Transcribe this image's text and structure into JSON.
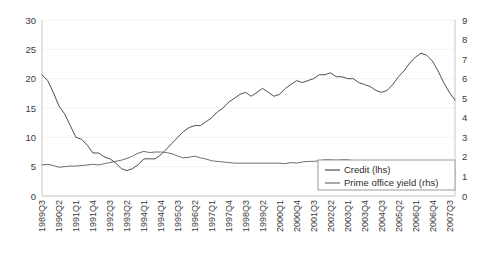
{
  "chart_data": {
    "type": "line",
    "title": "",
    "xlabel": "",
    "grid": false,
    "legend_position": "bottom-right",
    "axes": {
      "left": {
        "label": "",
        "ylim": [
          0,
          30
        ],
        "ticks": [
          0,
          5,
          10,
          15,
          20,
          25,
          30
        ],
        "tick_labels": [
          "0",
          "5",
          "10",
          "15",
          "20",
          "25",
          "30"
        ]
      },
      "right": {
        "label": "",
        "ylim": [
          0,
          9
        ],
        "ticks": [
          0,
          1,
          2,
          3,
          4,
          5,
          6,
          7,
          8,
          9
        ],
        "tick_labels": [
          "0",
          "1",
          "2",
          "3",
          "4",
          "5",
          "6",
          "7",
          "8",
          "9"
        ]
      }
    },
    "x": [
      "1989Q3",
      "1989Q4",
      "1990Q1",
      "1990Q2",
      "1990Q3",
      "1990Q4",
      "1991Q1",
      "1991Q2",
      "1991Q3",
      "1991Q4",
      "1992Q1",
      "1992Q2",
      "1992Q3",
      "1992Q4",
      "1993Q1",
      "1993Q2",
      "1993Q3",
      "1993Q4",
      "1994Q1",
      "1994Q2",
      "1994Q3",
      "1994Q4",
      "1995Q1",
      "1995Q2",
      "1995Q3",
      "1995Q4",
      "1996Q1",
      "1996Q2",
      "1996Q3",
      "1996Q4",
      "1997Q1",
      "1997Q2",
      "1997Q3",
      "1997Q4",
      "1998Q1",
      "1998Q2",
      "1998Q3",
      "1998Q4",
      "1999Q1",
      "1999Q2",
      "1999Q3",
      "1999Q4",
      "2000Q1",
      "2000Q2",
      "2000Q3",
      "2000Q4",
      "2001Q1",
      "2001Q2",
      "2001Q3",
      "2001Q4",
      "2002Q1",
      "2002Q2",
      "2002Q3",
      "2002Q4",
      "2003Q1",
      "2003Q2",
      "2003Q3",
      "2003Q4",
      "2004Q1",
      "2004Q2",
      "2004Q3",
      "2004Q4",
      "2005Q1",
      "2005Q2",
      "2005Q3",
      "2005Q4",
      "2006Q1",
      "2006Q2",
      "2006Q3",
      "2006Q4",
      "2007Q1",
      "2007Q2",
      "2007Q3",
      "2007Q4"
    ],
    "x_tick_labels": [
      "1989Q3",
      "1990Q2",
      "1991Q1",
      "1991Q4",
      "1992Q3",
      "1993Q2",
      "1994Q1",
      "1994Q4",
      "1995Q3",
      "1996Q2",
      "1997Q1",
      "1997Q4",
      "1998Q3",
      "1999Q2",
      "2000Q1",
      "2000Q4",
      "2001Q3",
      "2002Q2",
      "2003Q1",
      "2003Q4",
      "2004Q3",
      "2005Q2",
      "2006Q1",
      "2006Q4",
      "2007Q3"
    ],
    "x_tick_indices": [
      0,
      3,
      6,
      9,
      12,
      15,
      18,
      21,
      24,
      27,
      30,
      33,
      36,
      39,
      42,
      45,
      48,
      51,
      54,
      57,
      60,
      63,
      66,
      69,
      72
    ],
    "series": [
      {
        "name": "Credit (lhs)",
        "axis": "right",
        "color": "#4d4d4d",
        "values": [
          6.2,
          5.9,
          5.3,
          4.6,
          4.2,
          3.6,
          3.0,
          2.9,
          2.6,
          2.2,
          2.2,
          2.0,
          1.9,
          1.7,
          1.4,
          1.3,
          1.4,
          1.6,
          1.9,
          1.9,
          1.9,
          2.1,
          2.4,
          2.7,
          3.0,
          3.3,
          3.5,
          3.6,
          3.6,
          3.8,
          4.0,
          4.3,
          4.5,
          4.8,
          5.0,
          5.2,
          5.3,
          5.1,
          5.3,
          5.5,
          5.3,
          5.1,
          5.2,
          5.5,
          5.7,
          5.9,
          5.8,
          5.9,
          6.0,
          6.2,
          6.2,
          6.3,
          6.1,
          6.1,
          6.0,
          6.0,
          5.8,
          5.7,
          5.6,
          5.4,
          5.3,
          5.4,
          5.7,
          6.1,
          6.4,
          6.8,
          7.1,
          7.3,
          7.2,
          6.9,
          6.4,
          5.8,
          5.3,
          4.9
        ]
      },
      {
        "name": "Prime office yield (rhs)",
        "axis": "left",
        "color": "#6e6e6e",
        "values": [
          5.3,
          5.4,
          5.2,
          4.9,
          5.0,
          5.1,
          5.1,
          5.2,
          5.3,
          5.4,
          5.3,
          5.5,
          5.7,
          5.9,
          6.1,
          6.4,
          6.8,
          7.3,
          7.6,
          7.4,
          7.5,
          7.5,
          7.4,
          7.2,
          6.8,
          6.5,
          6.6,
          6.8,
          6.5,
          6.3,
          6.0,
          5.9,
          5.8,
          5.7,
          5.6,
          5.6,
          5.6,
          5.6,
          5.6,
          5.6,
          5.6,
          5.6,
          5.6,
          5.5,
          5.7,
          5.6,
          5.8,
          5.9,
          5.9,
          6.0,
          6.2,
          6.2,
          6.1,
          6.2,
          6.2,
          6.0,
          5.9,
          5.7,
          5.5,
          5.2,
          4.9,
          4.6,
          4.4,
          4.3,
          4.3,
          4.3,
          4.3,
          4.3,
          4.3,
          4.3,
          4.3,
          4.4,
          4.5,
          4.6
        ]
      }
    ],
    "legend": [
      {
        "label": "Credit (lhs)",
        "color": "#4d4d4d"
      },
      {
        "label": "Prime office yield (rhs)",
        "color": "#6e6e6e"
      }
    ]
  }
}
